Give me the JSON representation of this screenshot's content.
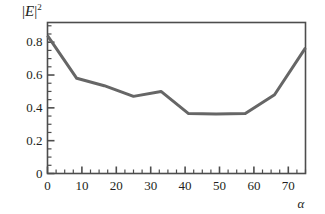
{
  "figure": {
    "name": "reflectance-vs-angle-plot",
    "background_color": "#ffffff",
    "frame_color": "#4d4d4d",
    "curve_color": "#666666",
    "text_color": "#231f20"
  },
  "axes": {
    "y_title_prefix": "|",
    "y_title_symbol": "E",
    "y_title_suffix": "|",
    "y_title_exponent": "2",
    "x_title": "α"
  },
  "chart_data": {
    "type": "line",
    "title": "",
    "subtitle": "",
    "xlabel": "α",
    "ylabel": "|E|²",
    "xlim": [
      0,
      75
    ],
    "ylim": [
      0,
      0.92
    ],
    "grid": false,
    "legend": null,
    "x_ticks": [
      0,
      10,
      20,
      30,
      40,
      50,
      60,
      70
    ],
    "x_tick_labels": [
      "0",
      "10",
      "20",
      "30",
      "40",
      "50",
      "60",
      "70"
    ],
    "x_minor_tick_step": 2.5,
    "y_ticks": [
      0,
      0.2,
      0.4,
      0.6,
      0.8
    ],
    "y_tick_labels": [
      "0",
      "0.2",
      "0.4",
      "0.6",
      "0.8"
    ],
    "y_minor_tick_step": 0.05,
    "series": [
      {
        "name": "|E|^2",
        "color": "#666666",
        "line_width": 3,
        "x": [
          0,
          8.5,
          16.5,
          25,
          33,
          41,
          49,
          57.5,
          66,
          75
        ],
        "values": [
          0.84,
          0.58,
          0.535,
          0.47,
          0.5,
          0.365,
          0.362,
          0.365,
          0.48,
          0.765
        ]
      }
    ]
  }
}
